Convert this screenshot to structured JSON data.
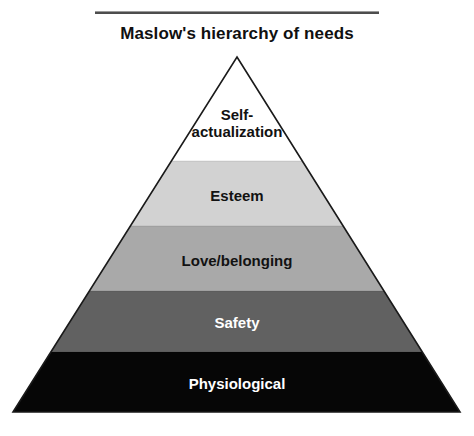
{
  "figure": {
    "title": "Maslow's hierarchy of needs",
    "alt_name": "maslow-hierarchy-of-needs-pyramid",
    "background_color": "#ffffff",
    "rule_color": "#4d4d4d"
  },
  "pyramid": {
    "apex": {
      "x": 237,
      "y": 57
    },
    "base_left": {
      "x": 13,
      "y": 412
    },
    "base_right": {
      "x": 460,
      "y": 412
    },
    "outline_color": "#1a1a1a",
    "levels": [
      {
        "rank": 5,
        "label": "Self-\nactualization",
        "label_flat": "Self-actualization",
        "fill": "#ffffff",
        "text_color": "#121212",
        "font_size": 15,
        "y_top": 57,
        "y_bottom": 161,
        "label_center_y": 124
      },
      {
        "rank": 4,
        "label": "Esteem",
        "label_flat": "Esteem",
        "fill": "#d2d2d2",
        "text_color": "#121212",
        "font_size": 15,
        "y_top": 161,
        "y_bottom": 226,
        "label_center_y": 196
      },
      {
        "rank": 3,
        "label": "Love/belonging",
        "label_flat": "Love/belonging",
        "fill": "#a9a9a9",
        "text_color": "#121212",
        "font_size": 15,
        "y_top": 226,
        "y_bottom": 291,
        "label_center_y": 261
      },
      {
        "rank": 2,
        "label": "Safety",
        "label_flat": "Safety",
        "fill": "#616161",
        "text_color": "#ffffff",
        "font_size": 15,
        "y_top": 291,
        "y_bottom": 352,
        "label_center_y": 323
      },
      {
        "rank": 1,
        "label": "Physiological",
        "label_flat": "Physiological",
        "fill": "#060606",
        "text_color": "#ffffff",
        "font_size": 15,
        "y_top": 352,
        "y_bottom": 412,
        "label_center_y": 384
      }
    ]
  }
}
